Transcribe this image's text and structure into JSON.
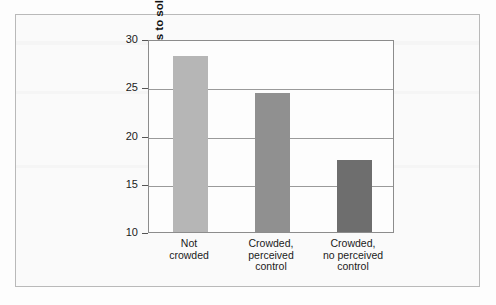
{
  "chart_data": {
    "type": "bar",
    "title": "",
    "xlabel": "",
    "ylabel": "Number of attempts to solve puzzles",
    "categories": [
      "Not\ncrowded",
      "Crowded,\nperceived\ncontrol",
      "Crowded,\nno perceived\ncontrol"
    ],
    "values": [
      28.2,
      24.4,
      17.5
    ],
    "ylim": [
      10,
      30
    ],
    "yticks": [
      10,
      15,
      20,
      25,
      30
    ],
    "ytick_labels": [
      "10",
      "15",
      "20",
      "25",
      "30"
    ],
    "grid": true,
    "legend": "none",
    "bar_colors": [
      "#b6b6b6",
      "#909090",
      "#6e6e6e"
    ]
  },
  "figure": {
    "frame_color": "#b9b9b9",
    "background_color": "#fafafa",
    "plot_background_color": "#fdfdfd",
    "axis_color": "#8c8c8c",
    "gridline_color": "#9a9a9a"
  }
}
